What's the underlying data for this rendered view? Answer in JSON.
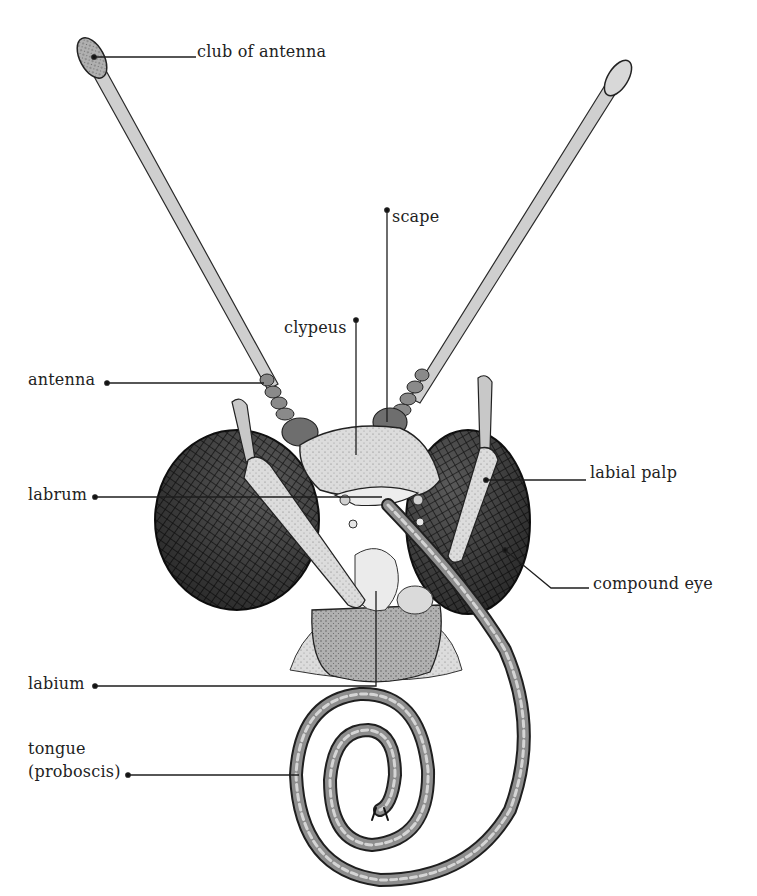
{
  "diagram": {
    "colors": {
      "ink": "#1e1e1e",
      "fill_light": "#e4e4e4",
      "fill_mid": "#b5b5b5",
      "eye": "#3a3a3a",
      "background": "#ffffff"
    },
    "labels": [
      {
        "id": "club-of-antenna",
        "text": "club of antenna",
        "x": 197,
        "y": 42,
        "line": [
          [
            94,
            57
          ],
          [
            196,
            57
          ]
        ]
      },
      {
        "id": "scape",
        "text": "scape",
        "x": 392,
        "y": 207,
        "line": [
          [
            387,
            210
          ],
          [
            387,
            422
          ]
        ]
      },
      {
        "id": "clypeus",
        "text": "clypeus",
        "x": 284,
        "y": 318,
        "line": [
          [
            356,
            320
          ],
          [
            356,
            455
          ]
        ]
      },
      {
        "id": "antenna",
        "text": "antenna",
        "x": 28,
        "y": 370,
        "line": [
          [
            107,
            383
          ],
          [
            264,
            383
          ]
        ]
      },
      {
        "id": "labrum",
        "text": "labrum",
        "x": 28,
        "y": 485,
        "line": [
          [
            95,
            497
          ],
          [
            382,
            497
          ]
        ]
      },
      {
        "id": "labial-palp",
        "text": "labial palp",
        "x": 590,
        "y": 463,
        "line": [
          [
            486,
            480
          ],
          [
            586,
            480
          ]
        ]
      },
      {
        "id": "compound-eye",
        "text": "compound eye",
        "x": 593,
        "y": 574,
        "line": [
          [
            505,
            550
          ],
          [
            551,
            588
          ],
          [
            589,
            588
          ]
        ]
      },
      {
        "id": "labium",
        "text": "labium",
        "x": 28,
        "y": 674,
        "line": [
          [
            95,
            686
          ],
          [
            376,
            686
          ],
          [
            376,
            591
          ]
        ]
      },
      {
        "id": "tongue",
        "text": "tongue",
        "x": 28,
        "y": 739
      },
      {
        "id": "proboscis",
        "text": "(proboscis)",
        "x": 28,
        "y": 762,
        "line": [
          [
            128,
            775
          ],
          [
            299,
            775
          ]
        ]
      }
    ]
  }
}
